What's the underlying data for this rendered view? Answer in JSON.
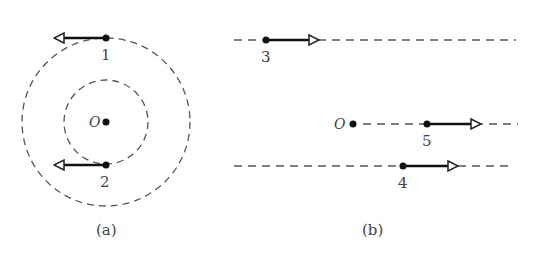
{
  "colors": {
    "stroke": "#333333",
    "dashed": "#555555",
    "text": "#444444",
    "background": "#ffffff"
  },
  "panel_a": {
    "caption": "(a)",
    "center_label": "O",
    "circles": [
      {
        "name": "outer",
        "radius": 84
      },
      {
        "name": "inner",
        "radius": 42
      }
    ],
    "points": [
      {
        "id": "1",
        "label": "1",
        "arrow_direction": "left"
      },
      {
        "id": "2",
        "label": "2",
        "arrow_direction": "left"
      }
    ]
  },
  "panel_b": {
    "caption": "(b)",
    "center_label": "O",
    "lines": [
      {
        "id": "top",
        "point_label": "3",
        "arrow_direction": "right"
      },
      {
        "id": "middle",
        "point_label": "5",
        "arrow_direction": "right"
      },
      {
        "id": "bottom",
        "point_label": "4",
        "arrow_direction": "right"
      }
    ]
  }
}
